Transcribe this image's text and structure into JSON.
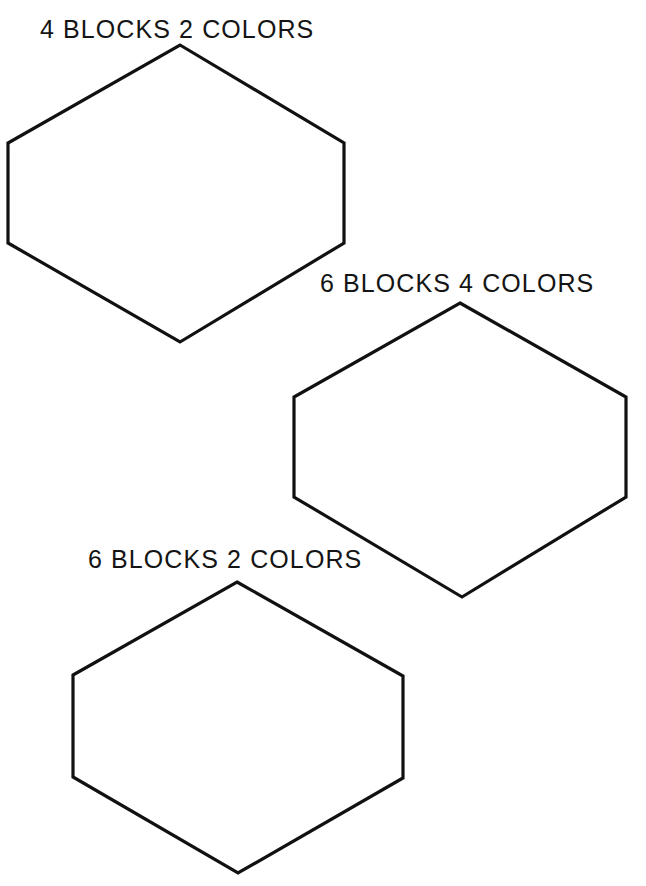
{
  "page": {
    "width": 646,
    "height": 886,
    "background_color": "#ffffff",
    "ink_color": "#111111",
    "header_partial_text": "GEOMETRIC COVERING"
  },
  "figures": [
    {
      "id": "hexagon-4-blocks-2-colors",
      "label": "4 BLOCKS 2 COLORS",
      "blocks": 4,
      "colors": 2,
      "shape": "hexagon",
      "points": "180,45 344,143 344,243 180,342 8,243 8,143"
    },
    {
      "id": "hexagon-6-blocks-4-colors",
      "label": "6 BLOCKS 4 COLORS",
      "blocks": 6,
      "colors": 4,
      "shape": "hexagon",
      "points": "460,303 626,397 626,497 462,597 294,497 294,397"
    },
    {
      "id": "hexagon-6-blocks-2-colors",
      "label": "6 BLOCKS 2 COLORS",
      "blocks": 6,
      "colors": 2,
      "shape": "hexagon",
      "points": "237,582 403,676 403,778 238,873 73,777 73,675"
    }
  ]
}
